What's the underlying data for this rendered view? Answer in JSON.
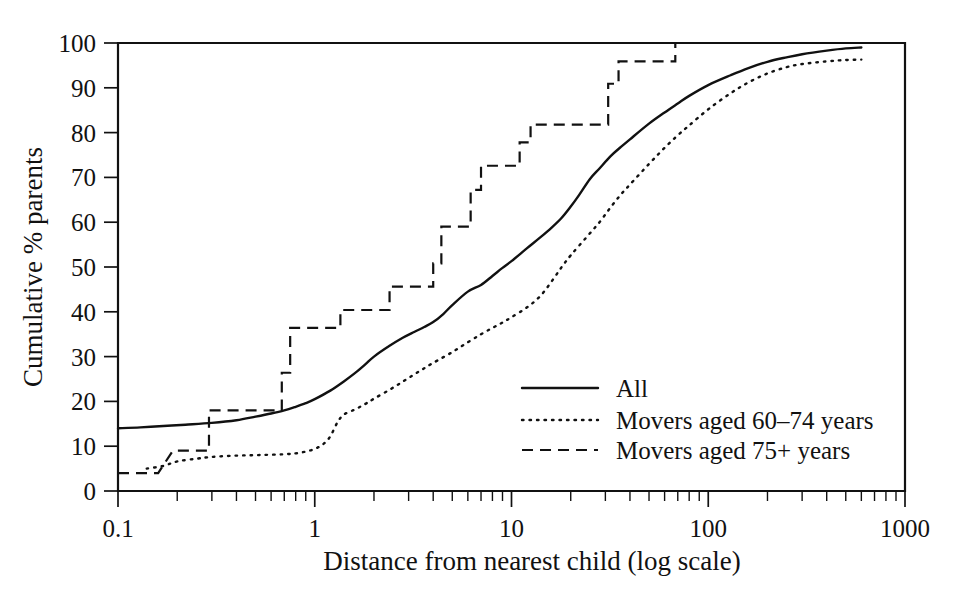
{
  "figure": {
    "background_color": "#ffffff",
    "ink_color": "#111111"
  },
  "chart_data": {
    "type": "line",
    "title": "",
    "subtitle": "",
    "xlabel": "Distance from nearest child (log scale)",
    "ylabel": "Cumulative % parents",
    "xscale": "log",
    "yscale": "linear",
    "xlim": [
      0.1,
      1000
    ],
    "ylim": [
      0,
      100
    ],
    "grid": false,
    "legend_position": "center-right-inside",
    "x_tick_labels": [
      "0.1",
      "1",
      "10",
      "100",
      "1000"
    ],
    "x_tick_values": [
      0.1,
      1,
      10,
      100,
      1000
    ],
    "y_tick_labels": [
      "0",
      "10",
      "20",
      "30",
      "40",
      "50",
      "60",
      "70",
      "80",
      "90",
      "100"
    ],
    "y_tick_values": [
      0,
      10,
      20,
      30,
      40,
      50,
      60,
      70,
      80,
      90,
      100
    ],
    "series": [
      {
        "name": "All",
        "style": "solid",
        "color": "#111111",
        "interpolation": "smooth",
        "x": [
          0.1,
          0.13,
          0.17,
          0.22,
          0.3,
          0.4,
          0.5,
          0.6,
          0.7,
          0.8,
          0.9,
          1.0,
          1.2,
          1.4,
          1.6,
          1.8,
          2.0,
          2.4,
          2.8,
          3.2,
          3.6,
          4.0,
          4.5,
          5.0,
          6.0,
          7.0,
          8.0,
          9.0,
          10,
          12,
          14,
          16,
          18,
          20,
          22,
          25,
          28,
          32,
          36,
          40,
          50,
          60,
          70,
          80,
          100,
          130,
          160,
          200,
          250,
          300,
          400,
          500,
          600
        ],
        "y": [
          14.0,
          14.2,
          14.5,
          14.8,
          15.2,
          15.8,
          16.6,
          17.3,
          18.0,
          18.8,
          19.6,
          20.5,
          22.4,
          24.4,
          26.3,
          28.2,
          30.0,
          32.4,
          34.2,
          35.5,
          36.6,
          37.7,
          39.5,
          41.5,
          44.5,
          46.0,
          48.0,
          49.8,
          51.3,
          54.2,
          56.6,
          58.8,
          61.0,
          63.5,
          66.0,
          69.6,
          72.0,
          74.8,
          76.8,
          78.5,
          82.0,
          84.5,
          86.5,
          88.2,
          90.6,
          92.8,
          94.4,
          95.8,
          96.8,
          97.5,
          98.3,
          98.8,
          99.0
        ],
        "start_value": 14.0,
        "end_value": 99.0
      },
      {
        "name": "Movers aged 60-74 years",
        "style": "dotted",
        "color": "#111111",
        "interpolation": "smooth",
        "x": [
          0.14,
          0.17,
          0.2,
          0.25,
          0.3,
          0.4,
          0.5,
          0.6,
          0.7,
          0.8,
          0.9,
          1.0,
          1.1,
          1.2,
          1.3,
          1.4,
          1.6,
          1.8,
          2.0,
          2.4,
          2.8,
          3.2,
          3.6,
          4.0,
          5.0,
          6.0,
          7.0,
          8.0,
          9.0,
          10,
          12,
          14,
          16,
          18,
          20,
          24,
          28,
          32,
          36,
          40,
          50,
          60,
          70,
          80,
          100,
          130,
          160,
          200,
          250,
          300,
          400,
          500,
          600
        ],
        "y": [
          5.0,
          5.6,
          6.6,
          7.2,
          7.6,
          7.9,
          8.0,
          8.1,
          8.2,
          8.4,
          8.8,
          9.4,
          10.4,
          12.2,
          15.2,
          17.0,
          18.2,
          19.4,
          20.6,
          22.6,
          24.4,
          26.0,
          27.4,
          28.6,
          31.0,
          33.2,
          35.0,
          36.4,
          37.6,
          38.8,
          41.0,
          43.5,
          46.8,
          50.0,
          52.6,
          56.6,
          60.0,
          63.4,
          66.2,
          68.4,
          73.0,
          76.6,
          79.4,
          81.6,
          85.2,
          88.8,
          91.2,
          93.2,
          94.6,
          95.3,
          95.9,
          96.2,
          96.3
        ],
        "start_value": 5.0,
        "end_value": 96.3
      },
      {
        "name": "Movers aged 75+ years",
        "style": "dashed-step",
        "color": "#111111",
        "interpolation": "step-post",
        "x": [
          0.1,
          0.16,
          0.19,
          0.29,
          0.29,
          0.68,
          0.68,
          0.75,
          0.75,
          1.35,
          1.35,
          1.55,
          1.55,
          2.4,
          2.4,
          4.0,
          4.0,
          4.4,
          4.4,
          6.2,
          6.2,
          7.0,
          7.0,
          11.0,
          11.0,
          12.5,
          12.5,
          14.5,
          14.5,
          31.0,
          31.0,
          35.0,
          35.0,
          54.0,
          54.0,
          68.0,
          68.0
        ],
        "y": [
          4.0,
          4.0,
          9.0,
          9.0,
          18.0,
          18.0,
          26.4,
          26.4,
          36.4,
          36.4,
          40.4,
          40.4,
          40.4,
          40.4,
          45.6,
          45.6,
          50.8,
          50.8,
          59.0,
          59.0,
          67.2,
          67.2,
          72.6,
          72.6,
          77.8,
          77.8,
          81.8,
          81.8,
          81.8,
          81.8,
          90.9,
          90.9,
          95.9,
          95.9,
          95.9,
          95.9,
          100.0
        ],
        "steps": [
          {
            "x_from": 0.1,
            "x_to": 0.16,
            "y": 4.0
          },
          {
            "x_from": 0.19,
            "x_to": 0.29,
            "y": 9.0
          },
          {
            "x_from": 0.29,
            "x_to": 0.68,
            "y": 18.0
          },
          {
            "x_from": 0.75,
            "x_to": 1.35,
            "y": 26.4
          },
          {
            "x_from": 1.4,
            "x_to": 1.55,
            "y": 36.4
          },
          {
            "x_from": 1.55,
            "x_to": 4.0,
            "y": 40.4
          },
          {
            "x_from": 4.2,
            "x_to": 4.4,
            "y": 45.6
          },
          {
            "x_from": 4.6,
            "x_to": 6.2,
            "y": 50.8
          },
          {
            "x_from": 6.4,
            "x_to": 7.0,
            "y": 59.0
          },
          {
            "x_from": 7.2,
            "x_to": 11.0,
            "y": 67.2
          },
          {
            "x_from": 11.5,
            "x_to": 12.5,
            "y": 72.6
          },
          {
            "x_from": 13.0,
            "x_to": 31.0,
            "y": 81.8
          },
          {
            "x_from": 31.5,
            "x_to": 35.0,
            "y": 90.9
          },
          {
            "x_from": 36.0,
            "x_to": 68.0,
            "y": 95.9
          },
          {
            "x_from": 68.0,
            "x_to": 68.0,
            "y": 100.0
          }
        ],
        "start_value": 4.0,
        "end_value": 100.0
      }
    ]
  },
  "axes": {
    "x_title": "Distance from nearest child (log scale)",
    "y_title": "Cumulative % parents",
    "x_ticks": [
      {
        "label": "0.1",
        "value": 0.1
      },
      {
        "label": "1",
        "value": 1
      },
      {
        "label": "10",
        "value": 10
      },
      {
        "label": "100",
        "value": 100
      },
      {
        "label": "1000",
        "value": 1000
      }
    ],
    "y_ticks": [
      {
        "label": "100",
        "value": 100
      },
      {
        "label": "90",
        "value": 90
      },
      {
        "label": "80",
        "value": 80
      },
      {
        "label": "70",
        "value": 70
      },
      {
        "label": "60",
        "value": 60
      },
      {
        "label": "50",
        "value": 50
      },
      {
        "label": "40",
        "value": 40
      },
      {
        "label": "30",
        "value": 30
      },
      {
        "label": "20",
        "value": 20
      },
      {
        "label": "10",
        "value": 10
      },
      {
        "label": "0",
        "value": 0
      }
    ]
  },
  "legend": {
    "items": [
      {
        "label": "All",
        "style": "solid"
      },
      {
        "label": "Movers aged 60–74 years",
        "style": "dotted"
      },
      {
        "label": "Movers aged 75+ years",
        "style": "dashed"
      }
    ]
  }
}
